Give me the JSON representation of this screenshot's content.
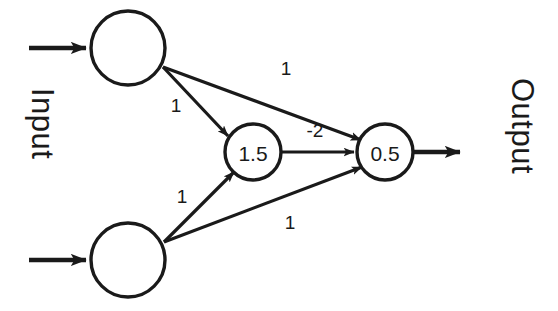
{
  "diagram": {
    "background_color": "#ffffff",
    "stroke_color": "#1a1a1a",
    "input_label": "Input",
    "output_label": "Output",
    "nodes": [
      {
        "id": "input-top",
        "label": "",
        "cx": 128,
        "cy": 48,
        "r": 37,
        "layer": "input"
      },
      {
        "id": "input-bottom",
        "label": "",
        "cx": 128,
        "cy": 260,
        "r": 37,
        "layer": "input"
      },
      {
        "id": "hidden",
        "label": "1.5",
        "cx": 253,
        "cy": 152,
        "r": 28,
        "layer": "hidden"
      },
      {
        "id": "output",
        "label": "0.5",
        "cx": 385,
        "cy": 152,
        "r": 28,
        "layer": "output"
      }
    ],
    "edges": [
      {
        "id": "top-to-hidden",
        "from": "input-top",
        "to": "hidden",
        "weight": "1",
        "label_x": 176,
        "label_y": 105
      },
      {
        "id": "top-to-output",
        "from": "input-top",
        "to": "output",
        "weight": "1",
        "label_x": 286,
        "label_y": 68
      },
      {
        "id": "bottom-to-hidden",
        "from": "input-bottom",
        "to": "hidden",
        "weight": "1",
        "label_x": 182,
        "label_y": 196
      },
      {
        "id": "bottom-to-output",
        "from": "input-bottom",
        "to": "output",
        "weight": "1",
        "label_x": 290,
        "label_y": 222
      },
      {
        "id": "hidden-to-output",
        "from": "hidden",
        "to": "output",
        "weight": "-2",
        "label_x": 315,
        "label_y": 130
      }
    ],
    "io_arrows": [
      {
        "id": "input-arrow-top",
        "x1": 29,
        "y1": 48,
        "x2": 91,
        "y2": 48
      },
      {
        "id": "input-arrow-bottom",
        "x1": 29,
        "y1": 260,
        "x2": 91,
        "y2": 260
      },
      {
        "id": "output-arrow",
        "x1": 413,
        "y1": 152,
        "x2": 465,
        "y2": 152
      }
    ]
  }
}
